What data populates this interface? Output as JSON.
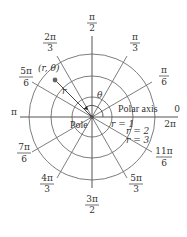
{
  "diagram": {
    "pole_label": "Pole",
    "polar_axis_label": "Polar axis",
    "point_label": "(r, θ)",
    "radius_label": "r",
    "angle_label": "θ",
    "circle_labels": [
      "r = 1",
      "r = 2",
      "r = 3"
    ],
    "colors": {
      "lines": "#6e6e6e",
      "text": "#333333",
      "point": "#555555"
    },
    "angles": [
      {
        "num": "0",
        "den": "",
        "extra": "2π",
        "deg": 0
      },
      {
        "num": "π",
        "den": "6",
        "deg": 30
      },
      {
        "num": "π",
        "den": "3",
        "deg": 60
      },
      {
        "num": "π",
        "den": "2",
        "deg": 90
      },
      {
        "num": "2π",
        "den": "3",
        "deg": 120
      },
      {
        "num": "5π",
        "den": "6",
        "deg": 150
      },
      {
        "num": "π",
        "den": "",
        "deg": 180
      },
      {
        "num": "7π",
        "den": "6",
        "deg": 210
      },
      {
        "num": "4π",
        "den": "3",
        "deg": 240
      },
      {
        "num": "3π",
        "den": "2",
        "deg": 270
      },
      {
        "num": "5π",
        "den": "3",
        "deg": 300
      },
      {
        "num": "11π",
        "den": "6",
        "deg": 330
      }
    ]
  }
}
